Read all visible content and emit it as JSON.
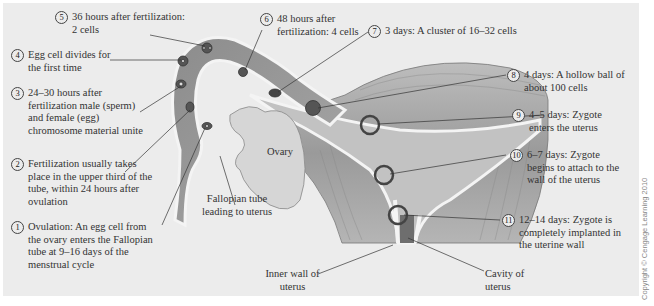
{
  "diagram": {
    "steps": [
      {
        "num": "1",
        "text": "Ovulation:  An egg cell from the ovary enters the Fallopian tube at 9–16 days of the menstrual cycle"
      },
      {
        "num": "2",
        "text": "Fertilization usually takes place in the upper third of the tube, within 24 hours after ovulation"
      },
      {
        "num": "3",
        "text": "24–30 hours after fertilization male (sperm) and female (egg) chromosome material unite"
      },
      {
        "num": "4",
        "text": "Egg cell divides for the first time"
      },
      {
        "num": "5",
        "text": "36 hours after fertilization:  2 cells"
      },
      {
        "num": "6",
        "text": "48 hours after fertilization:  4 cells"
      },
      {
        "num": "7",
        "text": "3 days:  A cluster of 16–32 cells"
      },
      {
        "num": "8",
        "text": "4 days:  A hollow ball of about 100 cells"
      },
      {
        "num": "9",
        "text": "4–5 days:  Zygote enters the uterus"
      },
      {
        "num": "10",
        "text": "6–7 days:  Zygote begins to attach to the wall of the uterus"
      },
      {
        "num": "11",
        "text": "12–14 days:  Zygote is completely implanted in the uterine wall"
      }
    ],
    "anatomy_labels": {
      "ovary": "Ovary",
      "fallopian_tube": "Fallopian tube leading to uterus",
      "inner_wall": "Inner wall of uterus",
      "cavity": "Cavity of uterus"
    },
    "copyright": "Copyright © Cengage Learning 2010"
  }
}
